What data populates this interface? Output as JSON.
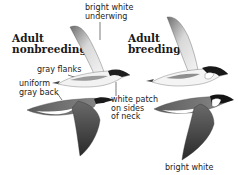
{
  "figure": {
    "headings": {
      "nonbreeding": [
        "Adult",
        "nonbreeding"
      ],
      "breeding": [
        "Adult",
        "breeding"
      ]
    },
    "callouts": {
      "underwing": [
        "bright white",
        "underwing"
      ],
      "flanks": "gray flanks",
      "back": [
        "uniform",
        "gray back"
      ],
      "neck": [
        "white patch",
        "on sides",
        "of neck"
      ],
      "bottom": "bright white"
    },
    "birds": [
      {
        "id": "nonbreeding-underside",
        "view": "underside",
        "plumage": "nonbreeding"
      },
      {
        "id": "breeding-underside",
        "view": "underside",
        "plumage": "breeding"
      },
      {
        "id": "nonbreeding-upperside",
        "view": "upperside",
        "plumage": "nonbreeding"
      },
      {
        "id": "breeding-upperside",
        "view": "upperside",
        "plumage": "breeding"
      }
    ],
    "colors": {
      "ink": "#1a1a1a",
      "gray_dark": "#4a4a4a",
      "gray_mid": "#7a7a7a",
      "gray_light": "#b8b8b8",
      "white": "#ffffff"
    }
  }
}
